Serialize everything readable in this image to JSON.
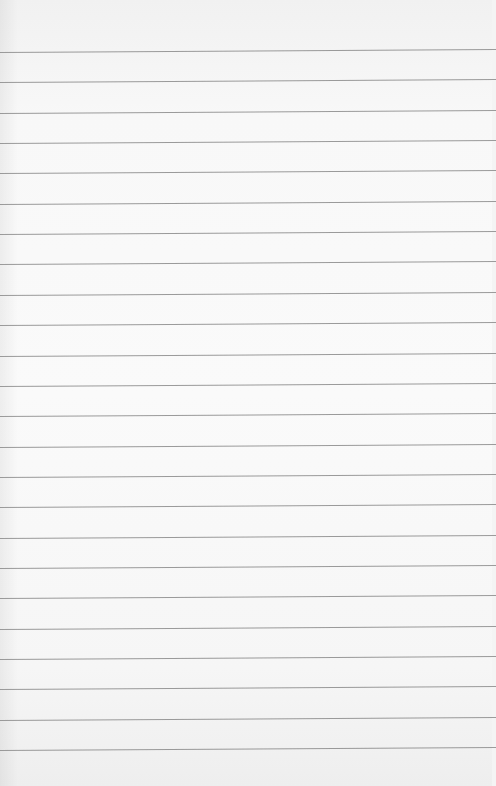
{
  "image": {
    "subject": "blank lined notebook paper",
    "background_color": "#f7f7f7",
    "rule_color": "#8a8a8a",
    "rule_count": 24,
    "first_rule_y": 52,
    "rule_spacing_px": 30.35
  }
}
